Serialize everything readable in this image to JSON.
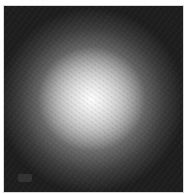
{
  "image": {
    "description": "Grayscale radial glow: bright white center fading to near-black edges inside a square frame",
    "caption_fragment": "· · ·",
    "center_color": "#ffffff",
    "edge_color": "#1a1a1a",
    "frame_border_color": "#d8d8d8",
    "background_color": "#ffffff"
  }
}
